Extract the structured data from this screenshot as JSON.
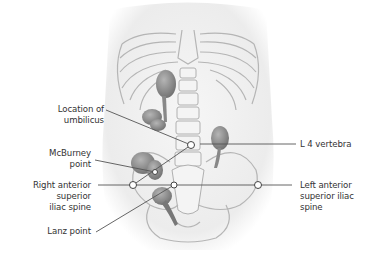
{
  "figure": {
    "labels_left": [
      {
        "id": "umbilicus",
        "lines": [
          "Location of",
          "umbilicus"
        ]
      },
      {
        "id": "mcburney",
        "lines": [
          "McBurney",
          "point"
        ]
      },
      {
        "id": "right_asis",
        "lines": [
          "Right anterior",
          "superior",
          "iliac spine"
        ]
      },
      {
        "id": "lanz",
        "lines": [
          "Lanz point"
        ]
      }
    ],
    "labels_right": [
      {
        "id": "l4",
        "lines": [
          "L 4 vertebra"
        ]
      },
      {
        "id": "left_asis",
        "lines": [
          "Left anterior",
          "superior iliac",
          "spine"
        ]
      }
    ],
    "colors": {
      "leader_line": "#555555",
      "bone_outline": "#b8b8b8",
      "body_shade": "#eeeeee",
      "organ": "#8a8a8a",
      "text": "#333333"
    }
  }
}
